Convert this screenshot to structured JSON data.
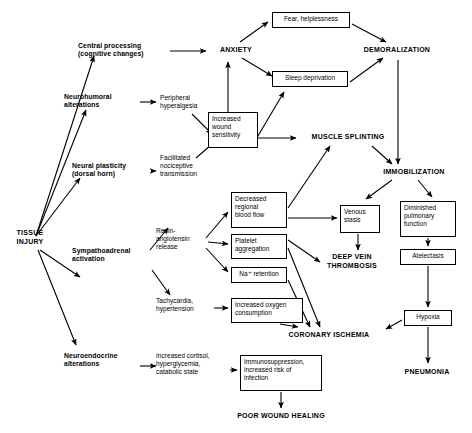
{
  "diagram": {
    "stroke_color": "#000000",
    "background_color": "#ffffff",
    "nodes": [
      {
        "id": "tissue_injury",
        "label": "TISSUE\nINJURY",
        "style": "caps",
        "x": 8,
        "y": 229,
        "w": 44,
        "h": 20
      },
      {
        "id": "central_processing",
        "label": "Central processing\n(cognitive changes)",
        "style": "plain-bold",
        "x": 78,
        "y": 42,
        "w": 86,
        "h": 18
      },
      {
        "id": "neurohumoral",
        "label": "Neurohumoral\nalterations",
        "style": "plain-bold",
        "x": 64,
        "y": 93,
        "w": 72,
        "h": 18
      },
      {
        "id": "neural_plasticity",
        "label": "Neural plasticity\n(dorsal horn)",
        "style": "plain-bold",
        "x": 72,
        "y": 162,
        "w": 76,
        "h": 18
      },
      {
        "id": "sympathoadrenal",
        "label": "Sympathoadrenal\nactivation",
        "style": "plain-bold",
        "x": 72,
        "y": 247,
        "w": 84,
        "h": 18
      },
      {
        "id": "neuroendocrine",
        "label": "Neuroendocrine\nalterations",
        "style": "plain-bold",
        "x": 64,
        "y": 352,
        "w": 80,
        "h": 18
      },
      {
        "id": "peripheral_hyper",
        "label": "Peripheral\nhyperalgesia",
        "style": "plain",
        "x": 160,
        "y": 94,
        "w": 54,
        "h": 18
      },
      {
        "id": "facilitated_noci",
        "label": "Facilitated\nnociceptive\ntransmission",
        "style": "plain",
        "x": 160,
        "y": 154,
        "w": 56,
        "h": 26
      },
      {
        "id": "renin",
        "label": "Renin-\nangiotensin\nrelease",
        "style": "plain",
        "x": 156,
        "y": 227,
        "w": 50,
        "h": 26
      },
      {
        "id": "tachycardia",
        "label": "Tachycardia,\nhypertension",
        "style": "plain",
        "x": 156,
        "y": 297,
        "w": 56,
        "h": 18
      },
      {
        "id": "increased_cortisol",
        "label": "Increased cortisol,\nhyperglycemia,\ncatabolic state",
        "style": "plain",
        "x": 156,
        "y": 352,
        "w": 72,
        "h": 26
      },
      {
        "id": "increased_wound",
        "label": "Increased\nwound\nsensitivity",
        "style": "boxed",
        "x": 208,
        "y": 112,
        "w": 50,
        "h": 36
      },
      {
        "id": "fear_helplessness",
        "label": "Fear, helplessness",
        "style": "boxed-ctr",
        "x": 272,
        "y": 12,
        "w": 78,
        "h": 16
      },
      {
        "id": "sleep_deprivation",
        "label": "Sleep deprivation",
        "style": "boxed-ctr",
        "x": 272,
        "y": 71,
        "w": 76,
        "h": 16
      },
      {
        "id": "decreased_flow",
        "label": "Decreased\nregional\nblood flow",
        "style": "boxed",
        "x": 231,
        "y": 192,
        "w": 56,
        "h": 36
      },
      {
        "id": "platelet_agg",
        "label": "Platelet\naggregation",
        "style": "boxed",
        "x": 231,
        "y": 234,
        "w": 56,
        "h": 25
      },
      {
        "id": "na_retention",
        "label": "Na⁺ retention",
        "style": "boxed-ctr",
        "x": 231,
        "y": 267,
        "w": 56,
        "h": 16
      },
      {
        "id": "increased_oxygen",
        "label": "Increased oxygen\nconsumption",
        "style": "boxed",
        "x": 231,
        "y": 298,
        "w": 72,
        "h": 25
      },
      {
        "id": "immunosuppression",
        "label": "Immunosuppression,\nincreased risk of\ninfection",
        "style": "boxed",
        "x": 240,
        "y": 355,
        "w": 82,
        "h": 36
      },
      {
        "id": "venous_stasis",
        "label": "Venous\nstasis",
        "style": "boxed",
        "x": 340,
        "y": 205,
        "w": 40,
        "h": 28
      },
      {
        "id": "diminished_pulm",
        "label": "Diminished\npulmonary\nfunction",
        "style": "boxed",
        "x": 400,
        "y": 201,
        "w": 56,
        "h": 36
      },
      {
        "id": "atelectasis",
        "label": "Atelectasis",
        "style": "boxed-ctr",
        "x": 400,
        "y": 249,
        "w": 56,
        "h": 16
      },
      {
        "id": "hypoxia",
        "label": "Hypoxia",
        "style": "boxed-ctr",
        "x": 404,
        "y": 310,
        "w": 48,
        "h": 16
      },
      {
        "id": "anxiety",
        "label": "ANXIETY",
        "style": "caps",
        "x": 210,
        "y": 46,
        "w": 52,
        "h": 10
      },
      {
        "id": "demoralization",
        "label": "DEMORALIZATION",
        "style": "caps",
        "x": 353,
        "y": 46,
        "w": 88,
        "h": 10
      },
      {
        "id": "muscle_splinting",
        "label": "MUSCLE SPLINTING",
        "style": "caps",
        "x": 300,
        "y": 133,
        "w": 96,
        "h": 10
      },
      {
        "id": "immobilization",
        "label": "IMMOBILIZATION",
        "style": "caps",
        "x": 370,
        "y": 168,
        "w": 88,
        "h": 10
      },
      {
        "id": "deep_vein_thrombosis",
        "label": "DEEP VEIN\nTHROMBOSIS",
        "style": "caps",
        "x": 318,
        "y": 253,
        "w": 68,
        "h": 20
      },
      {
        "id": "coronary_ischemia",
        "label": "CORONARY ISCHEMIA",
        "style": "caps",
        "x": 275,
        "y": 331,
        "w": 108,
        "h": 10
      },
      {
        "id": "pneumonia",
        "label": "PNEUMONIA",
        "style": "caps",
        "x": 392,
        "y": 368,
        "w": 70,
        "h": 10
      },
      {
        "id": "poor_wound_healing",
        "label": "POOR WOUND HEALING",
        "style": "caps",
        "x": 222,
        "y": 412,
        "w": 118,
        "h": 10
      }
    ],
    "edges": [
      {
        "from": "tissue_injury",
        "to": "central_processing",
        "path": "M36,236 L94,56"
      },
      {
        "from": "tissue_injury",
        "to": "neurohumoral",
        "path": "M36,236 L86,110"
      },
      {
        "from": "tissue_injury",
        "to": "neural_plasticity",
        "path": "M36,236 L80,178"
      },
      {
        "from": "tissue_injury",
        "to": "sympathoadrenal",
        "path": "M40,250 L80,277"
      },
      {
        "from": "tissue_injury",
        "to": "neuroendocrine",
        "path": "M38,250 L76,345"
      },
      {
        "from": "central_processing",
        "to": "anxiety",
        "path": "M170,51 L206,51"
      },
      {
        "from": "neurohumoral",
        "to": "peripheral_hyper",
        "path": "M140,102 L156,102"
      },
      {
        "from": "neural_plasticity",
        "to": "facilitated_noci",
        "path": "M152,171 L156,171"
      },
      {
        "from": "peripheral_hyper",
        "to": "increased_wound",
        "path": "M192,114 L212,134"
      },
      {
        "from": "facilitated_noci",
        "to": "increased_wound",
        "path": "M196,158 L218,139"
      },
      {
        "from": "increased_wound",
        "to": "anxiety",
        "path": "M228,112 L228,62"
      },
      {
        "from": "increased_wound",
        "to": "sleep_deprivation",
        "path": "M252,146 L284,92"
      },
      {
        "from": "increased_wound",
        "to": "muscle_splinting",
        "path": "M258,138 L296,138"
      },
      {
        "from": "anxiety",
        "to": "fear_helplessness",
        "path": "M240,42 L268,22"
      },
      {
        "from": "anxiety",
        "to": "sleep_deprivation",
        "path": "M242,58 L272,76"
      },
      {
        "from": "fear_helplessness",
        "to": "demoralization",
        "path": "M352,24 L386,42"
      },
      {
        "from": "sleep_deprivation",
        "to": "demoralization",
        "path": "M350,82 L383,58"
      },
      {
        "from": "demoralization",
        "to": "immobilization",
        "path": "M398,60 L398,164"
      },
      {
        "from": "muscle_splinting",
        "to": "immobilization",
        "path": "M372,146 L392,164"
      },
      {
        "from": "sympathoadrenal",
        "to": "renin",
        "path": "M150,250 L168,228"
      },
      {
        "from": "sympathoadrenal",
        "to": "tachycardia",
        "path": "M152,270 L170,295"
      },
      {
        "from": "neuroendocrine",
        "to": "increased_cortisol",
        "path": "M140,366 L156,366"
      },
      {
        "from": "renin",
        "to": "decreased_flow",
        "path": "M206,238 L228,212"
      },
      {
        "from": "renin",
        "to": "platelet_agg",
        "path": "M208,242 L228,244"
      },
      {
        "from": "renin",
        "to": "na_retention",
        "path": "M206,248 L228,272"
      },
      {
        "from": "tachycardia",
        "to": "increased_oxygen",
        "path": "M214,308 L228,308"
      },
      {
        "from": "increased_cortisol",
        "to": "immunosuppression",
        "path": "M230,370 L237,370"
      },
      {
        "from": "decreased_flow",
        "to": "muscle_splinting",
        "path": "M288,208 L330,146"
      },
      {
        "from": "decreased_flow",
        "to": "venous_stasis",
        "path": "M288,218 L337,218"
      },
      {
        "from": "immobilization",
        "to": "venous_stasis",
        "path": "M392,180 L366,199"
      },
      {
        "from": "immobilization",
        "to": "diminished_pulm",
        "path": "M418,180 L432,197"
      },
      {
        "from": "venous_stasis",
        "to": "deep_vein_thrombosis",
        "path": "M358,234 L358,250"
      },
      {
        "from": "platelet_agg",
        "to": "deep_vein_thrombosis",
        "path": "M288,240 L320,262"
      },
      {
        "from": "platelet_agg",
        "to": "coronary_ischemia",
        "path": "M288,248 L320,327"
      },
      {
        "from": "na_retention",
        "to": "coronary_ischemia",
        "path": "M288,280 L310,327"
      },
      {
        "from": "increased_oxygen",
        "to": "coronary_ischemia",
        "path": "M280,324 L298,327"
      },
      {
        "from": "diminished_pulm",
        "to": "atelectasis",
        "path": "M428,238 L428,246"
      },
      {
        "from": "atelectasis",
        "to": "hypoxia",
        "path": "M428,266 L428,307"
      },
      {
        "from": "hypoxia",
        "to": "coronary_ischemia",
        "path": "M402,320 L386,329"
      },
      {
        "from": "hypoxia",
        "to": "pneumonia",
        "path": "M428,327 L428,363"
      },
      {
        "from": "immunosuppression",
        "to": "poor_wound_healing",
        "path": "M281,392 L281,408"
      }
    ]
  }
}
